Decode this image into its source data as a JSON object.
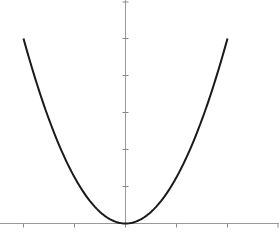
{
  "chart_data": {
    "type": "line",
    "title": "",
    "xlabel": "",
    "ylabel": "",
    "series": [
      {
        "name": "parabola",
        "function": "y = 1.25 * x^2",
        "x_range": [
          -2,
          2
        ]
      }
    ],
    "x_ticks": [
      -2,
      -1,
      0,
      1,
      2,
      3
    ],
    "y_ticks": [
      1,
      2,
      3,
      4,
      5,
      6
    ],
    "xlim": [
      -2,
      3
    ],
    "ylim": [
      0,
      6
    ],
    "grid": false,
    "legend": "none",
    "colors": {
      "curve": "#1a1a1a",
      "axis": "#9a9a9a"
    }
  }
}
